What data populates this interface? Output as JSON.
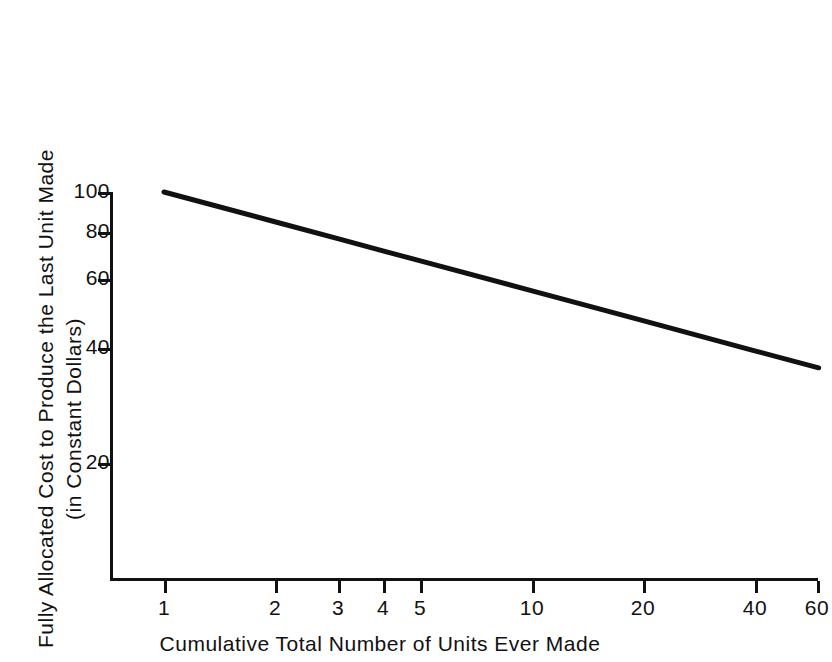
{
  "chart_data": {
    "type": "line",
    "title": "",
    "subtitle": "",
    "xlabel": "Cumulative Total Number of Units Ever Made",
    "ylabel": "Fully Allocated Cost to Produce the Last Unit Made",
    "ylabel_line1": "Fully  Allocated  Cost  to  Produce  the  Last  Unit  Made",
    "ylabel_line2": "(in  Constant  Dollars)",
    "xscale": "log",
    "yscale": "log",
    "xlim": [
      0.8,
      60
    ],
    "ylim": [
      14,
      115
    ],
    "grid": false,
    "legend": false,
    "legend_position": "none",
    "xticks": [
      1,
      2,
      3,
      4,
      5,
      10,
      20,
      40,
      60
    ],
    "xticklabels": [
      "1",
      "2",
      "3",
      "4",
      "5",
      "10",
      "20",
      "40",
      "60"
    ],
    "yticks": [
      20,
      40,
      60,
      80,
      100
    ],
    "yticklabels": [
      "20",
      "40",
      "60",
      "80",
      "100"
    ],
    "series": [
      {
        "name": "Experience curve",
        "color": "#111111",
        "linewidth": 5,
        "x": [
          1,
          2,
          3,
          4,
          5,
          10,
          20,
          40,
          60
        ],
        "y": [
          100,
          83.8,
          75.6,
          70.2,
          66.3,
          55.6,
          46.6,
          39.0,
          35.2
        ]
      }
    ],
    "annotations": []
  },
  "axis": {
    "y_tick_labels": [
      "100",
      "80",
      "60",
      "40",
      "20"
    ],
    "x_tick_labels": [
      "1",
      "2",
      "3",
      "4",
      "5",
      "10",
      "20",
      "40",
      "60"
    ],
    "x_title": "Cumulative Total Number of Units Ever Made",
    "y_title_line1": "Fully  Allocated  Cost  to  Produce  the  Last  Unit  Made",
    "y_title_line2": "(in  Constant  Dollars)"
  },
  "colors": {
    "line": "#111111",
    "axis": "#111111",
    "background": "#ffffff"
  }
}
